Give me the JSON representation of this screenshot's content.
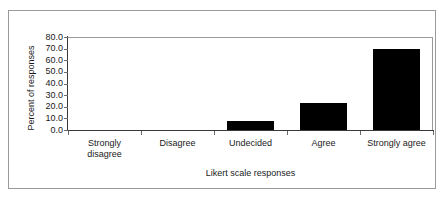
{
  "chart_data": {
    "type": "bar",
    "title": "",
    "xlabel": "Likert scale responses",
    "ylabel": "Percent of responses",
    "categories": [
      "Strongly disagree",
      "Disagree",
      "Undecided",
      "Agree",
      "Strongly agree"
    ],
    "category_lines": [
      [
        "Strongly",
        "disagree"
      ],
      [
        "Disagree"
      ],
      [
        "Undecided"
      ],
      [
        "Agree"
      ],
      [
        "Strongly agree"
      ]
    ],
    "values": [
      0.0,
      0.0,
      8.0,
      23.0,
      70.0
    ],
    "ylim": [
      0.0,
      80.0
    ],
    "ytick_step": 10.0,
    "ytick_labels": [
      "80.0",
      "70.0",
      "60.0",
      "50.0",
      "40.0",
      "30.0",
      "20.0",
      "10.0",
      "0.0"
    ],
    "ytick_values": [
      80.0,
      70.0,
      60.0,
      50.0,
      40.0,
      30.0,
      20.0,
      10.0,
      0.0
    ],
    "grid": false,
    "legend": false,
    "bar_color": "#000000",
    "axis_color": "#3a3a3a",
    "frame_color": "#9a9a9a",
    "background": "#ffffff"
  }
}
